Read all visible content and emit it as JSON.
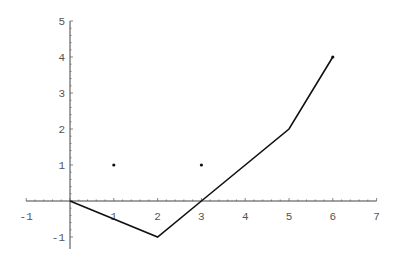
{
  "chart_data": {
    "type": "line",
    "title": "",
    "xlabel": "",
    "ylabel": "",
    "xlim": [
      -1,
      7
    ],
    "ylim": [
      -1,
      5
    ],
    "grid": false,
    "legend": null,
    "x_ticks": [
      -1,
      1,
      2,
      3,
      4,
      5,
      6,
      7
    ],
    "y_ticks": [
      -1,
      1,
      2,
      3,
      4,
      5
    ],
    "series": [
      {
        "name": "line",
        "type": "line",
        "color": "#111111",
        "points": [
          [
            0,
            0
          ],
          [
            2,
            -1
          ],
          [
            3,
            0
          ],
          [
            5,
            2
          ],
          [
            6,
            4
          ]
        ]
      },
      {
        "name": "points",
        "type": "scatter",
        "color": "#111111",
        "points": [
          [
            1,
            1
          ],
          [
            3,
            1
          ]
        ]
      }
    ]
  }
}
